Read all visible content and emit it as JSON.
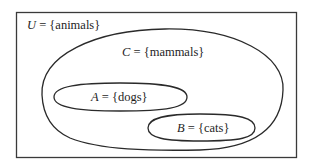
{
  "diagram": {
    "type": "venn-diagram",
    "stroke_color": "#2a2a2a",
    "background": "#ffffff",
    "universe": {
      "symbol": "U",
      "equals": " = ",
      "set": "{animals}"
    },
    "sets": [
      {
        "id": "C",
        "symbol": "C",
        "equals": " = ",
        "set": "{mammals}",
        "contained_in": "U"
      },
      {
        "id": "A",
        "symbol": "A",
        "equals": " = ",
        "set": "{dogs}",
        "contained_in": "C"
      },
      {
        "id": "B",
        "symbol": "B",
        "equals": " = ",
        "set": "{cats}",
        "contained_in": "C"
      }
    ]
  }
}
